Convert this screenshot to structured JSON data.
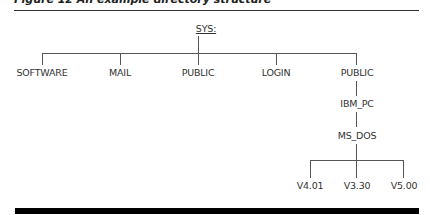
{
  "figure": {
    "caption": "Figure 12 An example directory structure",
    "root": "SYS:",
    "level1": [
      "SOFTWARE",
      "MAIL",
      "PUBLIC",
      "LOGIN",
      "PUBLIC"
    ],
    "chain": [
      "IBM_PC",
      "MS_DOS"
    ],
    "leaves": [
      "V4.01",
      "V3.30",
      "V5.00"
    ]
  }
}
